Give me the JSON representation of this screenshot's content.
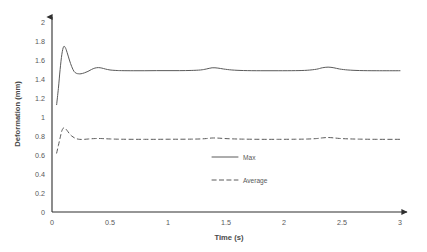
{
  "chart_data": {
    "type": "line",
    "title": "",
    "xlabel": "Time (s)",
    "ylabel": "Deformation (mm)",
    "xlim": [
      0,
      3
    ],
    "ylim": [
      0,
      2
    ],
    "grid": false,
    "legend_position": "inside-center",
    "xticks": [
      "0",
      "0.5",
      "1",
      "1.5",
      "2",
      "2.5",
      "3"
    ],
    "xtick_values": [
      0,
      0.5,
      1,
      1.5,
      2,
      2.5,
      3
    ],
    "yticks": [
      "0",
      "0.2",
      "0.4",
      "0.6",
      "0.8",
      "1",
      "1.2",
      "1.4",
      "1.6",
      "1.8",
      "2"
    ],
    "ytick_values": [
      0,
      0.2,
      0.4,
      0.6,
      0.8,
      1,
      1.2,
      1.4,
      1.6,
      1.8,
      2
    ],
    "series": [
      {
        "name": "Max",
        "style": "solid",
        "color": "#5a5a5a",
        "x": [
          0.04,
          0.055,
          0.07,
          0.085,
          0.1,
          0.115,
          0.13,
          0.15,
          0.17,
          0.19,
          0.21,
          0.23,
          0.25,
          0.28,
          0.31,
          0.34,
          0.37,
          0.4,
          0.43,
          0.46,
          0.5,
          0.55,
          0.6,
          0.7,
          0.8,
          0.9,
          1.0,
          1.1,
          1.2,
          1.28,
          1.33,
          1.38,
          1.43,
          1.48,
          1.55,
          1.65,
          1.8,
          1.95,
          2.1,
          2.2,
          2.28,
          2.33,
          2.38,
          2.43,
          2.48,
          2.55,
          2.65,
          2.8,
          3.0
        ],
        "y": [
          1.13,
          1.3,
          1.5,
          1.66,
          1.74,
          1.73,
          1.68,
          1.6,
          1.53,
          1.48,
          1.46,
          1.455,
          1.455,
          1.465,
          1.48,
          1.5,
          1.515,
          1.52,
          1.515,
          1.505,
          1.495,
          1.49,
          1.488,
          1.487,
          1.487,
          1.488,
          1.488,
          1.488,
          1.49,
          1.495,
          1.505,
          1.518,
          1.515,
          1.505,
          1.495,
          1.489,
          1.487,
          1.487,
          1.488,
          1.492,
          1.503,
          1.518,
          1.525,
          1.518,
          1.505,
          1.495,
          1.489,
          1.487,
          1.487
        ]
      },
      {
        "name": "Average",
        "style": "dashed",
        "color": "#5a5a5a",
        "x": [
          0.04,
          0.055,
          0.07,
          0.085,
          0.1,
          0.115,
          0.13,
          0.15,
          0.17,
          0.19,
          0.21,
          0.23,
          0.25,
          0.28,
          0.31,
          0.34,
          0.37,
          0.4,
          0.43,
          0.46,
          0.5,
          0.55,
          0.6,
          0.7,
          0.8,
          0.9,
          1.0,
          1.1,
          1.2,
          1.28,
          1.33,
          1.38,
          1.43,
          1.48,
          1.55,
          1.65,
          1.8,
          1.95,
          2.1,
          2.2,
          2.28,
          2.33,
          2.38,
          2.43,
          2.48,
          2.55,
          2.65,
          2.8,
          3.0
        ],
        "y": [
          0.62,
          0.7,
          0.78,
          0.855,
          0.885,
          0.878,
          0.858,
          0.825,
          0.8,
          0.783,
          0.772,
          0.766,
          0.764,
          0.765,
          0.768,
          0.771,
          0.773,
          0.774,
          0.773,
          0.771,
          0.769,
          0.767,
          0.766,
          0.765,
          0.765,
          0.765,
          0.766,
          0.766,
          0.767,
          0.769,
          0.773,
          0.779,
          0.778,
          0.774,
          0.77,
          0.767,
          0.765,
          0.765,
          0.766,
          0.768,
          0.773,
          0.78,
          0.784,
          0.78,
          0.774,
          0.77,
          0.767,
          0.765,
          0.765
        ]
      }
    ],
    "legend": [
      {
        "label": "Max",
        "style": "solid"
      },
      {
        "label": "Average",
        "style": "dashed"
      }
    ]
  }
}
